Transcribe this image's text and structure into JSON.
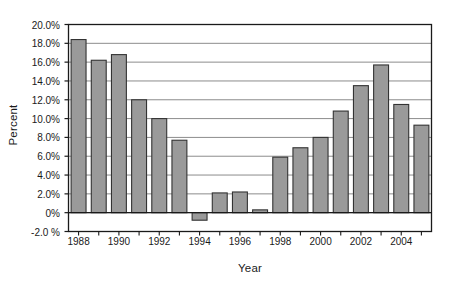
{
  "chart_data": {
    "type": "bar",
    "title": "",
    "subtitle": "",
    "xlabel": "Year",
    "ylabel": "Percent",
    "categories": [
      1988,
      1989,
      1990,
      1991,
      1992,
      1993,
      1994,
      1995,
      1996,
      1997,
      1998,
      1999,
      2000,
      2001,
      2002,
      2003,
      2004,
      2005
    ],
    "values": [
      18.4,
      16.2,
      16.8,
      12.0,
      10.0,
      7.7,
      -0.8,
      2.1,
      2.2,
      0.3,
      5.9,
      6.9,
      8.0,
      10.8,
      13.5,
      15.7,
      11.5,
      9.3
    ],
    "series": [
      {
        "name": "Percent",
        "values": [
          18.4,
          16.2,
          16.8,
          12.0,
          10.0,
          7.7,
          -0.8,
          2.1,
          2.2,
          0.3,
          5.9,
          6.9,
          8.0,
          10.8,
          13.5,
          15.7,
          11.5,
          9.3
        ]
      }
    ],
    "ylim": [
      -2.0,
      20.0
    ],
    "ytick_values": [
      20.0,
      18.0,
      16.0,
      14.0,
      12.0,
      10.0,
      8.0,
      6.0,
      4.0,
      2.0,
      0.0,
      -2.0
    ],
    "ytick_labels": [
      "20.0%",
      "18.0%",
      "16.0%",
      "14.0%",
      "12.0%",
      "10.0%",
      "8.0%",
      "6.0%",
      "4.0%",
      "2.0%",
      "0%",
      "-2.0 %"
    ],
    "xtick_labels": [
      "1988",
      "1990",
      "1992",
      "1994",
      "1996",
      "1998",
      "2000",
      "2002",
      "2004"
    ],
    "xtick_categories": [
      1988,
      1990,
      1992,
      1994,
      1996,
      1998,
      2000,
      2002,
      2004
    ],
    "grid": true,
    "grid_axis": "y",
    "legend": false,
    "legend_position": "none",
    "bar_fill_color": "#9a9a9a",
    "bar_edge_color": "#333333",
    "gridline_color": "#8c8c8c",
    "axis_color": "#1a1a1a",
    "plot_background": "#ffffff",
    "annotations": []
  }
}
